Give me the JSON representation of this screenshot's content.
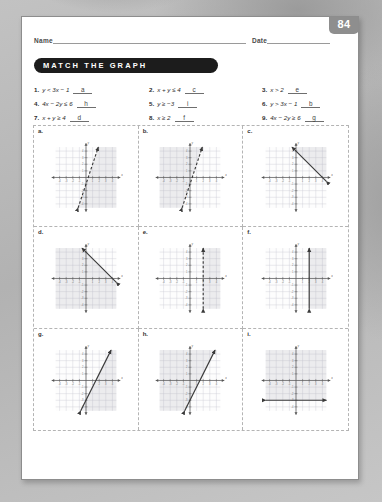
{
  "header": {
    "name_label": "Name",
    "date_label": "Date",
    "page_number": "84"
  },
  "title": "MATCH THE GRAPH",
  "problems": [
    {
      "num": "1.",
      "equation": "y < 3x − 1",
      "answer": "a"
    },
    {
      "num": "2.",
      "equation": "x + y ≤ 4",
      "answer": "c"
    },
    {
      "num": "3.",
      "equation": "x > 2",
      "answer": "e"
    },
    {
      "num": "4.",
      "equation": "4x − 2y ≤ 6",
      "answer": "h"
    },
    {
      "num": "5.",
      "equation": "y ≥ −3",
      "answer": "i"
    },
    {
      "num": "6.",
      "equation": "y > 3x − 1",
      "answer": "b"
    },
    {
      "num": "7.",
      "equation": "x + y ≥ 4",
      "answer": "d"
    },
    {
      "num": "8.",
      "equation": "x ≥ 2",
      "answer": "f"
    },
    {
      "num": "9.",
      "equation": "4x − 2y ≥ 6",
      "answer": "g"
    }
  ],
  "graphs": [
    {
      "label": "a.",
      "inequality": "y < 3x − 1",
      "line_style": "dashed",
      "slope": 3,
      "intercept": -1,
      "orientation": "oblique",
      "shade": "right"
    },
    {
      "label": "b.",
      "inequality": "y > 3x − 1",
      "line_style": "dashed",
      "slope": 3,
      "intercept": -1,
      "orientation": "oblique",
      "shade": "left"
    },
    {
      "label": "c.",
      "inequality": "x + y ≤ 4",
      "line_style": "solid",
      "slope": -1,
      "intercept": 4,
      "orientation": "oblique",
      "shade": "left"
    },
    {
      "label": "d.",
      "inequality": "x + y ≥ 4",
      "line_style": "solid",
      "slope": -1,
      "intercept": 4,
      "orientation": "oblique",
      "shade": "right"
    },
    {
      "label": "e.",
      "inequality": "x > 2",
      "line_style": "dashed",
      "orientation": "vertical",
      "at": 2,
      "shade": "right"
    },
    {
      "label": "f.",
      "inequality": "x ≥ 2",
      "line_style": "solid",
      "orientation": "vertical",
      "at": 2,
      "shade": "right"
    },
    {
      "label": "g.",
      "inequality": "4x − 2y ≥ 6",
      "line_style": "solid",
      "slope": 2,
      "intercept": -3,
      "orientation": "oblique",
      "shade": "right"
    },
    {
      "label": "h.",
      "inequality": "4x − 2y ≤ 6",
      "line_style": "solid",
      "slope": 2,
      "intercept": -3,
      "orientation": "oblique",
      "shade": "left"
    },
    {
      "label": "i.",
      "inequality": "y ≥ −3",
      "line_style": "solid",
      "orientation": "horizontal",
      "at": -3,
      "shade": "up"
    }
  ],
  "axis": {
    "x_label": "x",
    "y_label": "y",
    "x_min": -5,
    "x_max": 5,
    "y_min": -5,
    "y_max": 5
  },
  "colors": {
    "banner_bg": "#1c1c1c",
    "banner_text": "#ffffff",
    "page_badge_bg": "#8e8e8e",
    "paper": "#ffffff",
    "backdrop": "#b9b9b9",
    "grid_line": "#c9c9d4",
    "axis_line": "#555555",
    "plot_line": "#3a3a3a"
  }
}
